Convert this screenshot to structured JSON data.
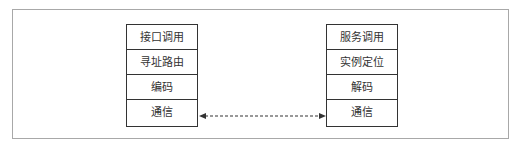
{
  "diagram": {
    "left_stack": {
      "layers": [
        "接口调用",
        "寻址路由",
        "编码",
        "通信"
      ]
    },
    "right_stack": {
      "layers": [
        "服务调用",
        "实例定位",
        "解码",
        "通信"
      ]
    },
    "connector": {
      "style": "dashed",
      "direction": "bidirectional",
      "from": "left_stack.通信",
      "to": "right_stack.通信"
    }
  }
}
